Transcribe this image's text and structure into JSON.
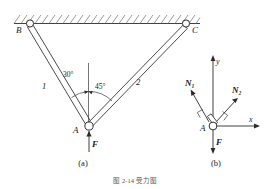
{
  "figure": {
    "caption": "图 2-14   受力图",
    "subfigures": [
      {
        "key": "a",
        "label": "(a)",
        "title": "结构图"
      },
      {
        "key": "b",
        "label": "(b)",
        "title": "受力图"
      }
    ]
  },
  "diagram_a": {
    "points": [
      {
        "id": "B",
        "label": "B",
        "kind": "pin-support",
        "x": 30,
        "y": 23
      },
      {
        "id": "C",
        "label": "C",
        "kind": "pin-support",
        "x": 186,
        "y": 23
      },
      {
        "id": "A",
        "label": "A",
        "kind": "pin-joint",
        "x": 88,
        "y": 126
      }
    ],
    "members": [
      {
        "id": "1",
        "label": "1",
        "from": "B",
        "to": "A"
      },
      {
        "id": "2",
        "label": "2",
        "from": "C",
        "to": "A"
      }
    ],
    "angles": [
      {
        "label": "30°",
        "value": 30,
        "unit": "deg",
        "between": "member-1 and vertical"
      },
      {
        "label": "45°",
        "value": 45,
        "unit": "deg",
        "between": "member-2 and vertical"
      }
    ],
    "loads": [
      {
        "label": "F",
        "at": "A",
        "direction": "down"
      }
    ],
    "support_surface": {
      "kind": "hatched-ceiling",
      "label": "fixed ceiling"
    }
  },
  "diagram_b": {
    "origin": {
      "id": "A",
      "label": "A"
    },
    "axes": [
      {
        "label": "x",
        "direction": "right"
      },
      {
        "label": "y",
        "direction": "up"
      }
    ],
    "forces": [
      {
        "label": "N₁",
        "direction": "up-left",
        "angle_from_vertical": 30
      },
      {
        "label": "N₂",
        "direction": "up-right",
        "angle_from_vertical": 45
      },
      {
        "label": "F",
        "direction": "down"
      }
    ],
    "right_angle_marks": 2
  },
  "colors": {
    "ink": "#2b2b2b",
    "hatch": "#6b6b6b",
    "paper": "#ffffff",
    "caption": "#555555"
  }
}
